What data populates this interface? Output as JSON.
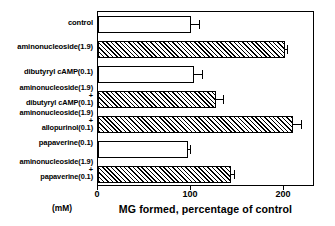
{
  "chart_data": {
    "type": "bar",
    "orientation": "horizontal",
    "title": "",
    "xlabel": "MG formed, percentage of control",
    "ylabel": "(mM)",
    "xlim": [
      0,
      233
    ],
    "xticks": [
      0,
      100,
      200
    ],
    "xtick_labels": [
      "0",
      "100",
      "200"
    ],
    "grid": false,
    "legend": null,
    "categories": [
      "control",
      "aminonucleoside(1.9)",
      "dibutyryl cAMP(0.1)",
      "aminonucleoside(1.9)\n+\ndibutyryl cAMP(0.1)",
      "aminonucleoside(1.9)\n+\nallopurinol(0.1)",
      "papaverine(0.1)",
      "aminonucleoside(1.9)\n+\npapaverine(0.1)"
    ],
    "values": [
      100,
      201,
      103,
      127,
      209,
      97,
      143
    ],
    "errors": [
      8,
      2,
      9,
      7,
      9,
      2,
      3
    ],
    "fills": [
      "open",
      "hatched",
      "open",
      "hatched",
      "hatched",
      "open",
      "hatched"
    ]
  },
  "axis": {
    "unit_label": "(mM)",
    "x_title": "MG formed, percentage of control"
  }
}
